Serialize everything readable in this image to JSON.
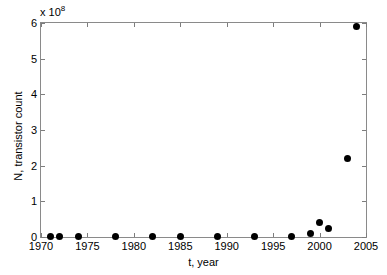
{
  "chart_data": {
    "type": "scatter",
    "title": "",
    "xlabel": "t, year",
    "ylabel": "N, transistor count",
    "y_multiplier_text": "x 10",
    "y_multiplier_exponent": "8",
    "y_scale": 100000000,
    "xlim": [
      1970,
      2005
    ],
    "ylim": [
      0,
      6
    ],
    "xticks": [
      1970,
      1975,
      1980,
      1985,
      1990,
      1995,
      2000,
      2005
    ],
    "xtick_labels": [
      "1970",
      "1975",
      "1980",
      "1985",
      "1990",
      "1995",
      "2000",
      "2005"
    ],
    "yticks": [
      0,
      1,
      2,
      3,
      4,
      5,
      6
    ],
    "ytick_labels": [
      "0",
      "1",
      "2",
      "3",
      "4",
      "5",
      "6"
    ],
    "grid": false,
    "legend": null,
    "marker": "filled-circle",
    "marker_color": "#000000",
    "axis_color": "#8a8a8a",
    "background_color": "#ffffff",
    "x": [
      1971,
      1972,
      1974,
      1978,
      1982,
      1985,
      1989,
      1993,
      1997,
      1999,
      2000,
      2001,
      2003,
      2004
    ],
    "y": [
      2.3e-06,
      3.5e-06,
      6.5e-06,
      2.9e-05,
      0.00013,
      0.00027,
      0.0012,
      0.0031,
      0.0075,
      0.095,
      0.42,
      0.25,
      2.2,
      5.9
    ],
    "points": [
      {
        "x": 1971,
        "y": 2.3e-06
      },
      {
        "x": 1972,
        "y": 3.5e-06
      },
      {
        "x": 1974,
        "y": 6.5e-06
      },
      {
        "x": 1978,
        "y": 2.9e-05
      },
      {
        "x": 1982,
        "y": 0.00013
      },
      {
        "x": 1985,
        "y": 0.00027
      },
      {
        "x": 1989,
        "y": 0.0012
      },
      {
        "x": 1993,
        "y": 0.0031
      },
      {
        "x": 1997,
        "y": 0.0075
      },
      {
        "x": 1999,
        "y": 0.095
      },
      {
        "x": 2000,
        "y": 0.42
      },
      {
        "x": 2001,
        "y": 0.25
      },
      {
        "x": 2003,
        "y": 2.2
      },
      {
        "x": 2004,
        "y": 5.9
      }
    ]
  }
}
